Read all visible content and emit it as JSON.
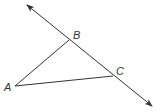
{
  "diagram": {
    "type": "geometry",
    "line_color": "#333333",
    "background": "#ffffff",
    "line": {
      "name": "line-BC",
      "from": [
        27,
        5
      ],
      "to": [
        152,
        106
      ],
      "arrows": "both"
    },
    "points": [
      {
        "name": "A",
        "label": "A",
        "x": 15,
        "y": 86,
        "label_x": 4,
        "label_y": 91
      },
      {
        "name": "B",
        "label": "B",
        "x": 69,
        "y": 40,
        "label_x": 73,
        "label_y": 39
      },
      {
        "name": "C",
        "label": "C",
        "x": 113,
        "y": 76,
        "label_x": 116,
        "label_y": 75
      }
    ],
    "segments": [
      {
        "name": "segment-AB",
        "from": "A",
        "to": "B"
      },
      {
        "name": "segment-AC",
        "from": "A",
        "to": "C"
      }
    ]
  }
}
